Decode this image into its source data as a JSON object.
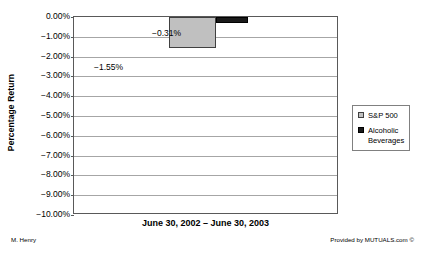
{
  "chart_data": {
    "type": "bar",
    "title": "",
    "subtitle": "",
    "xlabel": "June 30, 2002 – June 30, 2003",
    "ylabel": "Percentage Return",
    "categories": [
      "June 30, 2002 – June 30, 2003"
    ],
    "series": [
      {
        "name": "S&P 500",
        "values": [
          -1.55
        ],
        "color": "#c0c0c0",
        "label": "−1.55%"
      },
      {
        "name": "Alcoholic Beverages",
        "values": [
          -0.31
        ],
        "color": "#1a1a1a",
        "label": "−0.31%"
      }
    ],
    "ylim": [
      -10.0,
      0.0
    ],
    "ytick_values": [
      0.0,
      -1.0,
      -2.0,
      -3.0,
      -4.0,
      -5.0,
      -6.0,
      -7.0,
      -8.0,
      -9.0,
      -10.0
    ],
    "ytick_labels": [
      "0.00%",
      "−1.00%",
      "−2.00%",
      "−3.00%",
      "−4.00%",
      "−5.00%",
      "−6.00%",
      "−7.00%",
      "−8.00%",
      "−9.00%",
      "−10.00%"
    ],
    "grid": true,
    "grid_axis": "y",
    "legend_position": "right",
    "legend_entries": [
      "S&P 500",
      "Alcoholic Beverages"
    ],
    "data_labels": [
      "−1.55%",
      "−0.31%"
    ]
  },
  "axes": {
    "y_title": "Percentage Return",
    "x_title": "June 30, 2002 – June 30, 2003"
  },
  "legend": {
    "items": [
      {
        "label": "S&P 500",
        "swatch": "sp500"
      },
      {
        "label": "Alcoholic Beverages",
        "swatch": "alcohol"
      }
    ]
  },
  "footer": {
    "left": "M. Henry",
    "right": "Provided by MUTUALS.com ©"
  },
  "colors": {
    "sp500": "#c0c0c0",
    "alcoholic_beverages": "#1a1a1a",
    "gridline": "#a6a6a6",
    "axis": "#595959",
    "background": "#ffffff"
  }
}
